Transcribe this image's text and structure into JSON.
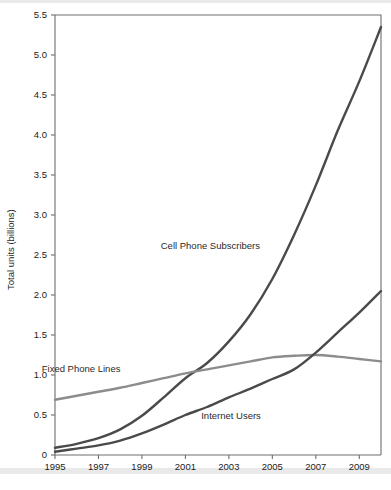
{
  "chart_data": {
    "type": "line",
    "title": "",
    "xlabel": "",
    "ylabel": "Total units (billions)",
    "xlim": [
      1995,
      2010
    ],
    "ylim": [
      0,
      5.5
    ],
    "grid": false,
    "legend_position": "inline-annotations",
    "x": [
      1995,
      1996,
      1997,
      1998,
      1999,
      2000,
      2001,
      2002,
      2003,
      2004,
      2005,
      2006,
      2007,
      2008,
      2009,
      2010
    ],
    "xticks": [
      "1995",
      "1997",
      "1999",
      "2001",
      "2003",
      "2005",
      "2007",
      "2009"
    ],
    "xtick_values": [
      1995,
      1997,
      1999,
      2001,
      2003,
      2005,
      2007,
      2009
    ],
    "yticks": [
      "0",
      "0.5",
      "1.0",
      "1.5",
      "2.0",
      "2.5",
      "3.0",
      "3.5",
      "4.0",
      "4.5",
      "5.0",
      "5.5"
    ],
    "ytick_values": [
      0,
      0.5,
      1.0,
      1.5,
      2.0,
      2.5,
      3.0,
      3.5,
      4.0,
      4.5,
      5.0,
      5.5
    ],
    "series": [
      {
        "name": "Cell Phone Subscribers",
        "color": "#4a4a4a",
        "values": [
          0.09,
          0.14,
          0.21,
          0.32,
          0.49,
          0.72,
          0.96,
          1.15,
          1.42,
          1.76,
          2.2,
          2.75,
          3.37,
          4.05,
          4.67,
          5.35
        ],
        "label_x": 2002.15,
        "label_y": 2.58
      },
      {
        "name": "Fixed Phone Lines",
        "color": "#8c8c8c",
        "values": [
          0.69,
          0.74,
          0.79,
          0.84,
          0.9,
          0.96,
          1.02,
          1.07,
          1.12,
          1.17,
          1.22,
          1.24,
          1.25,
          1.23,
          1.2,
          1.17
        ],
        "label_x": 1996.2,
        "label_y": 1.04
      },
      {
        "name": "Internet Users",
        "color": "#4a4a4a",
        "values": [
          0.04,
          0.08,
          0.12,
          0.18,
          0.27,
          0.38,
          0.5,
          0.6,
          0.72,
          0.83,
          0.95,
          1.07,
          1.28,
          1.53,
          1.78,
          2.05
        ],
        "label_x": 2003.1,
        "label_y": 0.45
      }
    ]
  },
  "figure": {
    "y_axis_title": "Total units (billions)"
  }
}
